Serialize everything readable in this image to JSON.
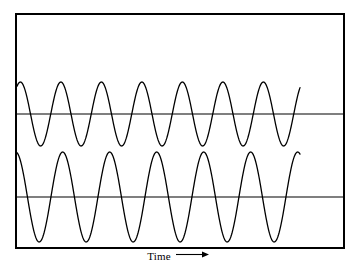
{
  "figure": {
    "background_color": "#ffffff",
    "stroke_color": "#000000",
    "frame": {
      "x": 16,
      "y": 14,
      "width": 328,
      "height": 234,
      "border_width": 2
    }
  },
  "axis": {
    "x_label": "Time",
    "x_arrow_icon": "right-arrow-icon"
  },
  "chart_data": {
    "type": "line",
    "title": "",
    "xlabel": "Time",
    "ylabel": "",
    "grid": false,
    "legend": null,
    "xlim": [
      0,
      328
    ],
    "ylim": [
      0,
      234
    ],
    "annotations": [
      "Time ⟶"
    ],
    "series": [
      {
        "name": "upper-waveform",
        "waveform": "sine",
        "cycles": 7,
        "baseline_y": 114,
        "peak_y": 82,
        "trough_y": 146,
        "amplitude_px": 32,
        "period_px": 40.5,
        "start_x": 17,
        "end_x": 300,
        "start_phase_deg": 60,
        "stroke_width": 1.3
      },
      {
        "name": "lower-waveform",
        "waveform": "sine",
        "cycles": 6,
        "baseline_y": 197,
        "peak_y": 156,
        "trough_y": 246,
        "amplitude_px": 45,
        "period_px": 47,
        "start_x": 17,
        "end_x": 300,
        "start_phase_deg": 100,
        "stroke_width": 1.3
      }
    ],
    "baselines": [
      {
        "name": "upper-baseline",
        "y": 114,
        "x_start": 17,
        "x_end": 343
      },
      {
        "name": "lower-baseline",
        "y": 197,
        "x_start": 17,
        "x_end": 343
      }
    ]
  }
}
